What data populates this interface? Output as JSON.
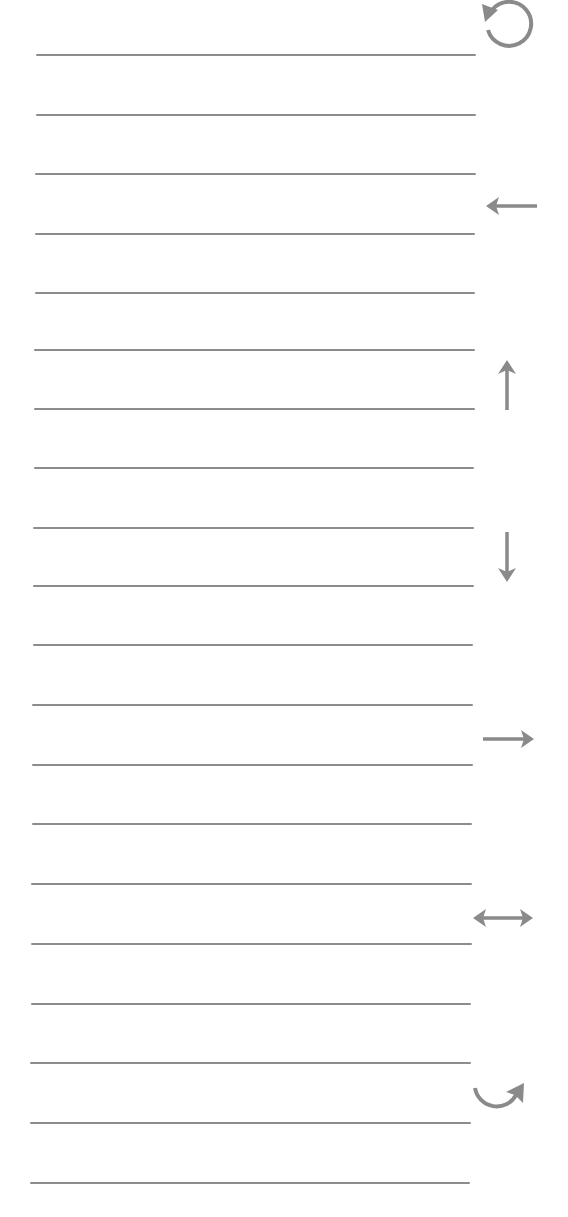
{
  "worksheet": {
    "line_color": "#8c8c8c",
    "icon_color": "#8a8a8a",
    "line_count": 20,
    "lines": [
      {
        "y": 55,
        "x1": 36,
        "x2": 476
      },
      {
        "y": 115,
        "x1": 36,
        "x2": 476
      },
      {
        "y": 174,
        "x1": 35,
        "x2": 476
      },
      {
        "y": 234,
        "x1": 35,
        "x2": 475
      },
      {
        "y": 293,
        "x1": 35,
        "x2": 475
      },
      {
        "y": 350,
        "x1": 34,
        "x2": 475
      },
      {
        "y": 409,
        "x1": 34,
        "x2": 475
      },
      {
        "y": 468,
        "x1": 34,
        "x2": 474
      },
      {
        "y": 528,
        "x1": 33,
        "x2": 474
      },
      {
        "y": 586,
        "x1": 33,
        "x2": 474
      },
      {
        "y": 645,
        "x1": 33,
        "x2": 473
      },
      {
        "y": 705,
        "x1": 32,
        "x2": 473
      },
      {
        "y": 765,
        "x1": 32,
        "x2": 473
      },
      {
        "y": 824,
        "x1": 32,
        "x2": 472
      },
      {
        "y": 884,
        "x1": 31,
        "x2": 472
      },
      {
        "y": 944,
        "x1": 31,
        "x2": 472
      },
      {
        "y": 1004,
        "x1": 31,
        "x2": 471
      },
      {
        "y": 1063,
        "x1": 30,
        "x2": 471
      },
      {
        "y": 1123,
        "x1": 30,
        "x2": 471
      },
      {
        "y": 1183,
        "x1": 30,
        "x2": 470
      }
    ],
    "icons": [
      {
        "name": "rotate-counterclockwise-icon",
        "label": "Rotate counterclockwise"
      },
      {
        "name": "arrow-left-icon",
        "label": "Left"
      },
      {
        "name": "arrow-up-icon",
        "label": "Up"
      },
      {
        "name": "arrow-down-icon",
        "label": "Down"
      },
      {
        "name": "arrow-right-icon",
        "label": "Right"
      },
      {
        "name": "arrow-left-right-icon",
        "label": "Left and right"
      },
      {
        "name": "turn-clockwise-icon",
        "label": "Turn clockwise"
      }
    ]
  }
}
